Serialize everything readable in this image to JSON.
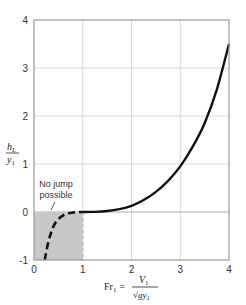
{
  "chart_data": {
    "type": "line",
    "title": "",
    "xlabel": "Fr1 = V1 / sqrt(g y1)",
    "ylabel": "hL / y1",
    "xlim": [
      0,
      4
    ],
    "ylim": [
      -1,
      4
    ],
    "x_ticks": [
      "0",
      "1",
      "2",
      "3",
      "4"
    ],
    "y_ticks": [
      "-1",
      "0",
      "1",
      "2",
      "3",
      "4"
    ],
    "grid": true,
    "series": [
      {
        "name": "head loss (physical, Fr1 > 1)",
        "style": "solid",
        "x": [
          1.0,
          1.25,
          1.5,
          1.75,
          2.0,
          2.25,
          2.5,
          2.75,
          3.0,
          3.25,
          3.5,
          3.75,
          4.0
        ],
        "y": [
          0.0,
          0.003,
          0.02,
          0.06,
          0.13,
          0.25,
          0.42,
          0.65,
          0.95,
          1.35,
          1.85,
          2.55,
          3.5
        ]
      },
      {
        "name": "head loss (non-physical, Fr1 < 1)",
        "style": "dashed",
        "x": [
          0.22,
          0.3,
          0.4,
          0.5,
          0.6,
          0.7,
          0.8,
          0.9,
          1.0
        ],
        "y": [
          -1.0,
          -0.6,
          -0.3,
          -0.15,
          -0.07,
          -0.03,
          -0.01,
          -0.002,
          0.0
        ]
      }
    ],
    "annotations": [
      {
        "text": "No jump possible",
        "region": "shaded x:[0,1], y:[-1,0]"
      }
    ]
  },
  "labels": {
    "ylabel_num": "h",
    "ylabel_num_sub": "L",
    "ylabel_den": "y",
    "ylabel_den_sub": "1",
    "xlabel_lhs": "Fr",
    "xlabel_lhs_sub": "1",
    "xlabel_eq": "=",
    "xlabel_num": "V",
    "xlabel_num_sub": "1",
    "xlabel_den": "√gy",
    "xlabel_den_sub": "1",
    "note_line1": "No jump",
    "note_line2": "possible"
  },
  "colors": {
    "curve": "#111111",
    "grid": "#d8d8d8",
    "axis": "#999999",
    "shade": "#c8c8c8"
  }
}
